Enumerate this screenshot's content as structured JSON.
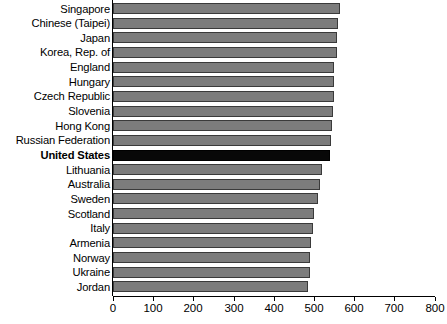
{
  "chart_data": {
    "type": "bar",
    "orientation": "horizontal",
    "title": "",
    "xlabel": "",
    "ylabel": "",
    "xlim": [
      0,
      800
    ],
    "xticks": [
      0,
      100,
      200,
      300,
      400,
      500,
      600,
      700,
      800
    ],
    "xtick_labels": [
      "0",
      "100",
      "200",
      "300",
      "400",
      "500",
      "600",
      "700",
      "800"
    ],
    "grid": false,
    "legend": "none",
    "highlight_category": "United States",
    "colors": {
      "bar_fill": "#7c7c7c",
      "bar_border": "#3a3a3a",
      "highlight_fill": "#080808",
      "highlight_border": "#000000",
      "axis": "#000000",
      "background": "#ffffff",
      "text": "#000000"
    },
    "categories": [
      "Singapore",
      "Chinese (Taipei)",
      "Japan",
      "Korea, Rep. of",
      "England",
      "Hungary",
      "Czech Republic",
      "Slovenia",
      "Hong Kong",
      "Russian Federation",
      "United States",
      "Lithuania",
      "Australia",
      "Sweden",
      "Scotland",
      "Italy",
      "Armenia",
      "Norway",
      "Ukraine",
      "Jordan"
    ],
    "values": [
      566,
      561,
      558,
      558,
      551,
      549,
      549,
      548,
      544,
      543,
      541,
      519,
      515,
      511,
      500,
      498,
      493,
      491,
      489,
      484
    ]
  }
}
